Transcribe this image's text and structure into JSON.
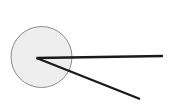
{
  "canvas": {
    "width": 171,
    "height": 112,
    "background_color": "#ffffff",
    "title": "Angle formed by two rays from a point inside a circle"
  },
  "colors": {
    "circle_fill": "#eeeeee",
    "circle_stroke": "#8c8c8c",
    "ray_stroke": "#1a1a1a",
    "background": "#ffffff"
  },
  "shapes": {
    "circle": {
      "name": "circle",
      "center_x": 41.5,
      "center_y": 57,
      "radius": 30.5,
      "fill": "#eeeeee",
      "stroke": "#8c8c8c",
      "stroke_width": 1
    },
    "vertex": {
      "name": "vertex-point",
      "x": 36.5,
      "y": 58
    },
    "rays": [
      {
        "name": "horizontal-ray",
        "x1": 36.5,
        "y1": 58,
        "x2": 163,
        "y2": 56,
        "stroke": "#1a1a1a",
        "stroke_width": 2.4
      },
      {
        "name": "diagonal-ray",
        "x1": 36.5,
        "y1": 58,
        "x2": 140,
        "y2": 99,
        "stroke": "#1a1a1a",
        "stroke_width": 2.4
      }
    ]
  }
}
